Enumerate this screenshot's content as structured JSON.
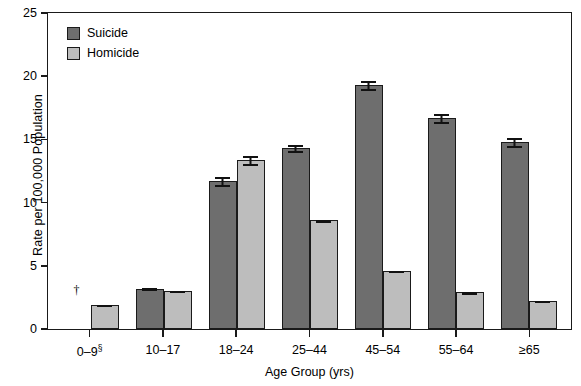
{
  "chart_data": {
    "type": "bar",
    "title": "",
    "xlabel": "Age Group (yrs)",
    "ylabel": "Rate per 100,000 Population",
    "ylim": [
      0,
      25
    ],
    "yticks": [
      0,
      5,
      10,
      15,
      20,
      25
    ],
    "grid": false,
    "legend_position": "top-left",
    "categories": [
      "0–9§",
      "10–17",
      "18–24",
      "25–44",
      "45–54",
      "55–64",
      "≥65"
    ],
    "categories_plain": [
      "0-9",
      "10-17",
      "18-24",
      "25-44",
      "45-54",
      "55-64",
      "65+"
    ],
    "series": [
      {
        "name": "Suicide",
        "color": "#6e6e6e",
        "values": [
          null,
          3.2,
          11.7,
          14.3,
          19.3,
          16.7,
          14.8
        ],
        "errors": [
          null,
          0.1,
          0.4,
          0.3,
          0.4,
          0.4,
          0.4
        ]
      },
      {
        "name": "Homicide",
        "color": "#bdbdbd",
        "values": [
          1.9,
          3.0,
          13.4,
          8.6,
          4.6,
          2.9,
          2.2
        ],
        "errors": [
          0.1,
          0.1,
          0.4,
          0.1,
          0.1,
          0.1,
          0.1
        ]
      }
    ],
    "annotations": [
      {
        "category_index": 0,
        "series_index": 0,
        "symbol": "†",
        "meaning": "suppressed / rate not shown"
      }
    ],
    "footnote_symbols": [
      "†",
      "§"
    ]
  },
  "legend": {
    "items": [
      {
        "label": "Suicide",
        "color": "#6e6e6e"
      },
      {
        "label": "Homicide",
        "color": "#bdbdbd"
      }
    ]
  },
  "axes": {
    "y": {
      "title": "Rate per 100,000 Population",
      "ticks": [
        "25",
        "20",
        "15",
        "10",
        "5",
        "0"
      ]
    },
    "x": {
      "title": "Age Group (yrs)",
      "ticks": [
        "0–9",
        "10–17",
        "18–24",
        "25–44",
        "45–54",
        "55–64",
        "≥65"
      ],
      "first_tick_superscript": "§"
    }
  },
  "colors": {
    "suicide": "#6e6e6e",
    "homicide": "#bdbdbd",
    "axis": "#1a1a1a",
    "background": "#ffffff"
  }
}
